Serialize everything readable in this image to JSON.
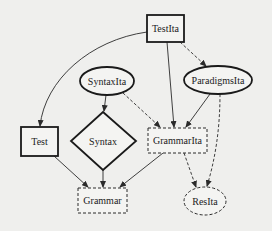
{
  "diagram": {
    "nodes": {
      "testita": {
        "label": "TestIta",
        "shape": "box",
        "style": "bold"
      },
      "syntaxita": {
        "label": "SyntaxIta",
        "shape": "ellipse",
        "style": "bold"
      },
      "paradigmsita": {
        "label": "ParadigmsIta",
        "shape": "ellipse",
        "style": "bold"
      },
      "test": {
        "label": "Test",
        "shape": "box",
        "style": "bold"
      },
      "syntax": {
        "label": "Syntax",
        "shape": "diamond",
        "style": "bold"
      },
      "grammarita": {
        "label": "GrammarIta",
        "shape": "box",
        "style": "dashed"
      },
      "grammar": {
        "label": "Grammar",
        "shape": "box",
        "style": "dashed"
      },
      "resita": {
        "label": "ResIta",
        "shape": "ellipse",
        "style": "dashed"
      }
    },
    "edges": [
      {
        "from": "TestIta",
        "to": "Test",
        "style": "solid"
      },
      {
        "from": "TestIta",
        "to": "GrammarIta",
        "style": "solid"
      },
      {
        "from": "TestIta",
        "to": "ParadigmsIta",
        "style": "dashed"
      },
      {
        "from": "SyntaxIta",
        "to": "Syntax",
        "style": "solid"
      },
      {
        "from": "SyntaxIta",
        "to": "GrammarIta",
        "style": "dashed"
      },
      {
        "from": "ParadigmsIta",
        "to": "GrammarIta",
        "style": "solid"
      },
      {
        "from": "ParadigmsIta",
        "to": "ResIta",
        "style": "dashed"
      },
      {
        "from": "Test",
        "to": "Grammar",
        "style": "solid"
      },
      {
        "from": "Syntax",
        "to": "Grammar",
        "style": "solid"
      },
      {
        "from": "GrammarIta",
        "to": "Grammar",
        "style": "solid"
      },
      {
        "from": "GrammarIta",
        "to": "ResIta",
        "style": "dashed"
      }
    ]
  }
}
